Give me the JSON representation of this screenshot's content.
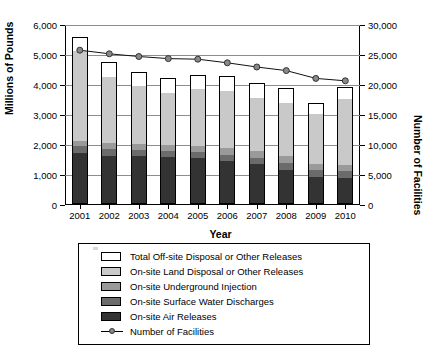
{
  "axes": {
    "x_title": "Year",
    "y_left_title": "Millions of Pounds",
    "y_right_title": "Number of Facilities",
    "y_left_ticks": [
      "0",
      "1,000",
      "2,000",
      "3,000",
      "4,000",
      "5,000",
      "6,000"
    ],
    "y_right_ticks": [
      "0",
      "5,000",
      "10,000",
      "15,000",
      "20,000",
      "25,000",
      "30,000"
    ],
    "x_ticks": [
      "2001",
      "2002",
      "2003",
      "2004",
      "2005",
      "2006",
      "2007",
      "2008",
      "2009",
      "2010"
    ]
  },
  "legend": {
    "items": [
      {
        "label": "Total Off-site Disposal or Other Releases",
        "color": "#ffffff",
        "type": "swatch"
      },
      {
        "label": "On-site Land Disposal or Other Releases",
        "color": "#c9c9c9",
        "type": "swatch"
      },
      {
        "label": "On-site Underground Injection",
        "color": "#9a9a9a",
        "type": "swatch"
      },
      {
        "label": "On-site Surface Water Discharges",
        "color": "#6b6b6b",
        "type": "swatch"
      },
      {
        "label": "On-site Air Releases",
        "color": "#333333",
        "type": "swatch"
      },
      {
        "label": "Number of Facilities",
        "color": "#888888",
        "type": "line"
      }
    ]
  },
  "chart_data": {
    "type": "bar",
    "title": "",
    "xlabel": "Year",
    "ylabel": "Millions of Pounds",
    "ylabel_secondary": "Number of Facilities",
    "ylim": [
      0,
      6000
    ],
    "ylim_secondary": [
      0,
      30000
    ],
    "grid": true,
    "legend_position": "bottom",
    "stacked": true,
    "categories": [
      "2001",
      "2002",
      "2003",
      "2004",
      "2005",
      "2006",
      "2007",
      "2008",
      "2009",
      "2010"
    ],
    "series": [
      {
        "name": "On-site Air Releases",
        "axis": "left",
        "color": "#333333",
        "values": [
          1700,
          1610,
          1600,
          1560,
          1520,
          1420,
          1330,
          1140,
          900,
          880
        ]
      },
      {
        "name": "On-site Surface Water Discharges",
        "axis": "left",
        "color": "#6b6b6b",
        "values": [
          230,
          230,
          210,
          210,
          230,
          230,
          220,
          230,
          225,
          230
        ]
      },
      {
        "name": "On-site Underground Injection",
        "axis": "left",
        "color": "#9a9a9a",
        "values": [
          170,
          180,
          180,
          190,
          200,
          210,
          210,
          215,
          200,
          200
        ]
      },
      {
        "name": "On-site Land Disposal or Other Releases",
        "axis": "left",
        "color": "#c9c9c9",
        "values": [
          3000,
          2220,
          1940,
          1750,
          1880,
          1920,
          1790,
          1780,
          1680,
          2200
        ]
      },
      {
        "name": "Total Off-site Disposal or Other Releases",
        "axis": "left",
        "color": "#ffffff",
        "values": [
          480,
          510,
          480,
          490,
          480,
          480,
          500,
          490,
          360,
          400
        ]
      }
    ],
    "totals": [
      5580,
      4750,
      4410,
      4200,
      4310,
      4260,
      4050,
      3855,
      3365,
      3910
    ],
    "line_series": {
      "name": "Number of Facilities",
      "axis": "right",
      "color": "#888888",
      "marker": "circle",
      "values": [
        25800,
        25200,
        24750,
        24400,
        24300,
        23700,
        23000,
        22400,
        21100,
        20700
      ]
    }
  }
}
